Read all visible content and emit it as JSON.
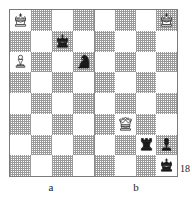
{
  "figure": {
    "type": "chess-diagram-pair",
    "page_number": "18",
    "labels": {
      "left": "a",
      "right": "b"
    },
    "colors": {
      "board_light": "#ffffff",
      "board_dark": "#9a9a9a",
      "border": "#7a7a7a",
      "piece_black": "#1a1a1a",
      "piece_white_fill": "#ffffff",
      "piece_outline": "#1a1a1a",
      "text": "#1a1a1a"
    },
    "boards": [
      {
        "id": "board-a",
        "label": "a",
        "columns": 4,
        "rows": 8,
        "top_left_square_shade": "light",
        "pieces": [
          {
            "piece": "white-king",
            "color": "white",
            "type": "king",
            "col": 0,
            "row": 0,
            "square_shade": "light",
            "glyph": "♔"
          },
          {
            "piece": "black-king",
            "color": "black",
            "type": "king",
            "col": 2,
            "row": 1,
            "square_shade": "dark",
            "glyph": "♚"
          },
          {
            "piece": "white-pawn",
            "color": "white",
            "type": "pawn",
            "col": 0,
            "row": 2,
            "square_shade": "light",
            "glyph": "♙"
          },
          {
            "piece": "black-knight",
            "color": "black",
            "type": "knight",
            "col": 3,
            "row": 2,
            "square_shade": "dark",
            "glyph": "♞"
          }
        ]
      },
      {
        "id": "board-b",
        "label": "b",
        "columns": 4,
        "rows": 8,
        "top_left_square_shade": "light",
        "pieces": [
          {
            "piece": "white-king",
            "color": "white",
            "type": "king",
            "col": 3,
            "row": 0,
            "square_shade": "dark",
            "glyph": "♔"
          },
          {
            "piece": "white-queen",
            "color": "white",
            "type": "queen",
            "col": 1,
            "row": 5,
            "square_shade": "light",
            "glyph": "♕"
          },
          {
            "piece": "black-rook",
            "color": "black",
            "type": "rook",
            "col": 2,
            "row": 6,
            "square_shade": "light",
            "glyph": "♜"
          },
          {
            "piece": "black-pawn",
            "color": "black",
            "type": "pawn",
            "col": 3,
            "row": 6,
            "square_shade": "dark",
            "glyph": "♟"
          },
          {
            "piece": "black-king",
            "color": "black",
            "type": "king",
            "col": 3,
            "row": 7,
            "square_shade": "light",
            "glyph": "♚"
          }
        ]
      }
    ]
  }
}
